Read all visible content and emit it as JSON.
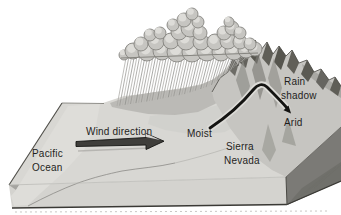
{
  "diagram": {
    "type": "rain-shadow-block-diagram",
    "labels": {
      "wind_direction": "Wind direction",
      "pacific_ocean": [
        "Pacific",
        "Ocean"
      ],
      "moist": "Moist",
      "sierra_nevada": [
        "Sierra",
        "Nevada"
      ],
      "rain_shadow": [
        "Rain",
        "shadow"
      ],
      "arid": "Arid"
    },
    "colors": {
      "background": "#ffffff",
      "terrain": "#d8d7d3",
      "ocean": "#deddd9",
      "front_face": "#d4d3cf",
      "left_face": "#a5a4a0",
      "right_face": "#7b7a76",
      "slope_shade": "#b4b3af",
      "mountain": "#c6c5c1",
      "mountain_shadow": "#57564f",
      "cloud": "#c6c5c1",
      "cloud_outline": "#868580",
      "cloud_highlight": "#dddcd8",
      "rain": "#989793",
      "rain_light": "#a9a8a4",
      "rain_pale": "#b3b2ae",
      "rain_dark": "#8e8d89",
      "arrow_black": "#141412",
      "text": "#1f1e1c"
    }
  }
}
